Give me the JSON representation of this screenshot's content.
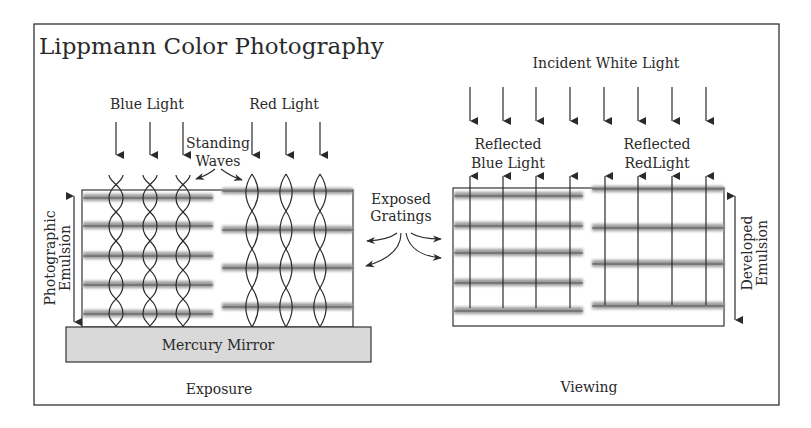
{
  "title": "Lippmann Color Photography",
  "exposure": {
    "caption": "Exposure",
    "blue_light": "Blue Light",
    "red_light": "Red Light",
    "standing_waves_line1": "Standing",
    "standing_waves_line2": "Waves",
    "emulsion_line1": "Photographic",
    "emulsion_line2": "Emulsion",
    "mirror": "Mercury Mirror"
  },
  "middle": {
    "line1": "Exposed",
    "line2": "Gratings"
  },
  "viewing": {
    "caption": "Viewing",
    "incident": "Incident White Light",
    "reflected_blue_line1": "Reflected",
    "reflected_blue_line2": "Blue Light",
    "reflected_red_line1": "Reflected",
    "reflected_red_line2": "RedLight",
    "emulsion_line1": "Developed",
    "emulsion_line2": "Emulsion"
  },
  "colors": {
    "ink": "#2a2a2a",
    "grating": "#8c8c8c",
    "mirror_fill": "#d9d9d9"
  }
}
